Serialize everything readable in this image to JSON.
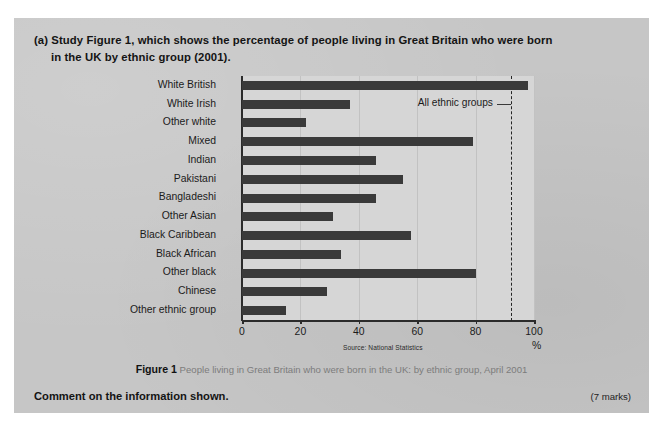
{
  "question": {
    "line1": "(a) Study Figure 1, which shows the percentage of people living in Great Britain who were born",
    "line2": "in the UK by ethnic group (2001)."
  },
  "caption": {
    "fig_label": "Figure 1",
    "text": "People living in Great Britain who were born in the UK: by ethnic group, April 2001"
  },
  "bottom": {
    "instruction": "Comment on the information shown.",
    "marks": "(7 marks)"
  },
  "chart_data": {
    "type": "bar",
    "orientation": "horizontal",
    "title": "",
    "xlabel": "%",
    "ylabel": "",
    "source": "Source: National Statistics",
    "xlim": [
      0,
      100
    ],
    "xticks": [
      0,
      20,
      40,
      60,
      80,
      100
    ],
    "grid": true,
    "bar_color": "#3a3a3a",
    "plot_background": "#d6d6d6",
    "categories": [
      "White British",
      "White Irish",
      "Other white",
      "Mixed",
      "Indian",
      "Pakistani",
      "Bangladeshi",
      "Other Asian",
      "Black Caribbean",
      "Black African",
      "Other black",
      "Chinese",
      "Other ethnic group"
    ],
    "values": [
      98,
      37,
      22,
      79,
      46,
      55,
      46,
      31,
      58,
      34,
      80,
      29,
      15
    ],
    "annotations": [
      {
        "label": "All ethnic groups",
        "value": 92,
        "style": "dashed-vertical-line",
        "line_color": "#252525"
      }
    ]
  }
}
